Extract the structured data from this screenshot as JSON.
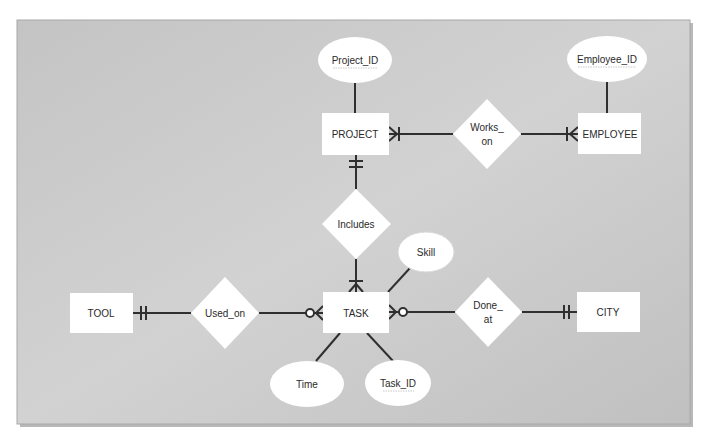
{
  "diagram": {
    "type": "entity-relationship",
    "colors": {
      "panel_bg": "#c9c9c9",
      "panel_border": "#9a9a9a",
      "shape_fill": "#ffffff",
      "line": "#2f2f2f",
      "text": "#2a2a2a"
    },
    "entities": [
      {
        "id": "project",
        "label": "PROJECT"
      },
      {
        "id": "employee",
        "label": "EMPLOYEE"
      },
      {
        "id": "task",
        "label": "TASK"
      },
      {
        "id": "tool",
        "label": "TOOL"
      },
      {
        "id": "city",
        "label": "CITY"
      }
    ],
    "relationships": [
      {
        "id": "works_on",
        "line1": "Works_",
        "line2": "on",
        "between": [
          "PROJECT",
          "EMPLOYEE"
        ],
        "cardinality": [
          "one-or-many",
          "one-or-many"
        ]
      },
      {
        "id": "includes",
        "label": "Includes",
        "between": [
          "PROJECT",
          "TASK"
        ],
        "cardinality": [
          "exactly-one",
          "one-or-many"
        ]
      },
      {
        "id": "used_on",
        "label": "Used_on",
        "between": [
          "TOOL",
          "TASK"
        ],
        "cardinality": [
          "exactly-one",
          "zero-or-many"
        ]
      },
      {
        "id": "done_at",
        "line1": "Done_",
        "line2": "at",
        "between": [
          "TASK",
          "CITY"
        ],
        "cardinality": [
          "zero-or-many",
          "exactly-one"
        ]
      }
    ],
    "attributes": [
      {
        "id": "project_id",
        "label": "Project_ID",
        "of": "PROJECT",
        "key": true
      },
      {
        "id": "employee_id",
        "label": "Employee_ID",
        "of": "EMPLOYEE",
        "key": true
      },
      {
        "id": "skill",
        "label": "Skill",
        "of": "TASK",
        "key": false
      },
      {
        "id": "time",
        "label": "Time",
        "of": "TASK",
        "key": false
      },
      {
        "id": "task_id",
        "label": "Task_ID",
        "of": "TASK",
        "key": true
      }
    ]
  }
}
